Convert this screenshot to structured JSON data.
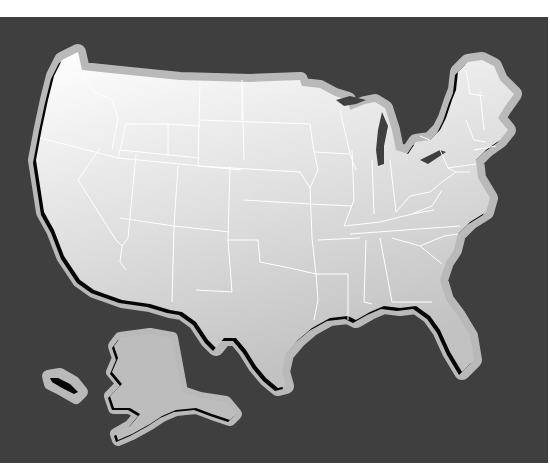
{
  "map": {
    "title": "",
    "subject": "United States outline map (lower 48 states with state borders, Alaska inset)",
    "colors": {
      "page": "#ffffff",
      "ocean": "#3f3f3f",
      "halo": "#b9b9b9",
      "land_light": "#fafafa",
      "land_dark": "#c4c4c4",
      "alaska_land": "#bdbdbd",
      "border": "#ffffff",
      "shadow": "#050505"
    },
    "regions": [
      {
        "name": "Lower 48 States",
        "style": "gradient-filled, white state borders"
      },
      {
        "name": "Alaska",
        "style": "flat gray inset"
      },
      {
        "name": "Aleutian Islands",
        "style": "small island group"
      }
    ],
    "labels": []
  }
}
